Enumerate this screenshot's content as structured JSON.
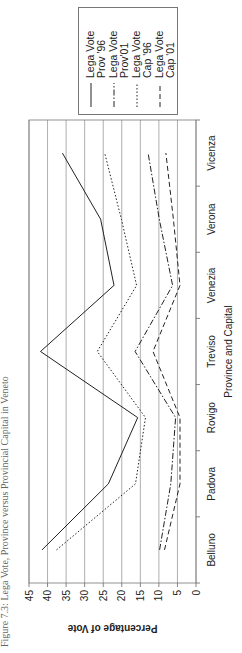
{
  "caption": "Figure 7.3: Lega Vote, Province versus Provincial Capital in Veneto",
  "chart_data": {
    "type": "line",
    "title": "",
    "xlabel": "Province and Capital",
    "ylabel": "Percentage of Vote",
    "categories": [
      "Belluno",
      "Padova",
      "Rovigo",
      "Treviso",
      "Venezia",
      "Verona",
      "Vicenza"
    ],
    "ylim": [
      0,
      45
    ],
    "yticks": [
      0,
      5,
      10,
      15,
      20,
      25,
      30,
      35,
      40,
      45
    ],
    "grid": true,
    "legend_position": "right",
    "series": [
      {
        "name": "Lega Vote Prov '96",
        "legend": [
          "Lega Vote",
          "Prov '96"
        ],
        "style": "solid",
        "values": [
          41.5,
          23.6,
          15.7,
          41.9,
          22.1,
          25.7,
          36.0
        ]
      },
      {
        "name": "Lega Vote Prov'01",
        "legend": [
          "Lega Vote",
          "Prov'01"
        ],
        "style": "dashdot",
        "values": [
          9.8,
          6.8,
          5.5,
          16.4,
          6.3,
          9.9,
          12.9
        ]
      },
      {
        "name": "Lega Vote Cap '96",
        "legend": [
          "Lega Vote",
          "Cap '96"
        ],
        "style": "dotted",
        "values": [
          37.6,
          16.3,
          13.6,
          26.6,
          16.0,
          20.1,
          24.6
        ]
      },
      {
        "name": "Lega Vote Cap '01",
        "legend": [
          "Lega Vote",
          "Cap '01"
        ],
        "style": "dashed",
        "values": [
          8.5,
          4.3,
          4.3,
          11.6,
          4.3,
          6.1,
          8.1
        ]
      }
    ]
  }
}
